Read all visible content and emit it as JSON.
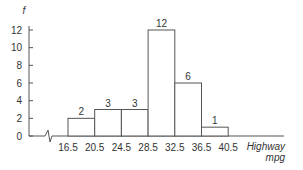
{
  "chart_data": {
    "type": "bar",
    "title": "",
    "ylabel": "f",
    "xlabel": "Highway mpg",
    "xlabel_lines": [
      "Highway",
      "mpg"
    ],
    "categories": [
      "16.5–20.5",
      "20.5–24.5",
      "24.5–28.5",
      "28.5–32.5",
      "32.5–36.5",
      "36.5–40.5"
    ],
    "bin_edges": [
      16.5,
      20.5,
      24.5,
      28.5,
      32.5,
      36.5,
      40.5
    ],
    "x_tick_labels": [
      "16.5",
      "20.5",
      "24.5",
      "28.5",
      "32.5",
      "36.5",
      "40.5"
    ],
    "values": [
      2,
      3,
      3,
      12,
      6,
      1
    ],
    "data_labels": [
      "2",
      "3",
      "3",
      "12",
      "6",
      "1"
    ],
    "y_ticks": [
      0,
      2,
      4,
      6,
      8,
      10,
      12
    ],
    "y_tick_labels": [
      "0",
      "2",
      "4",
      "6",
      "8",
      "10",
      "12"
    ],
    "ylim": [
      0,
      12
    ],
    "axis_break": true,
    "grid": false,
    "legend": null,
    "bar_fill": "#ffffff",
    "line_color": "#555555"
  }
}
